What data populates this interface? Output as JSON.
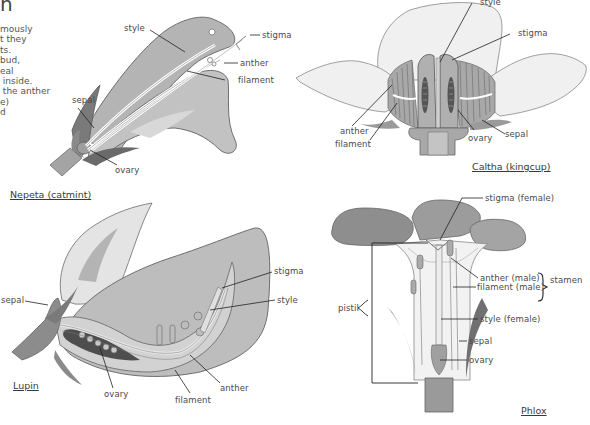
{
  "intro_text": {
    "heading_fragment": "n",
    "lines": [
      "mously",
      "t they",
      "ts.",
      "bud,",
      "eal",
      " inside.",
      " the anther",
      "e)",
      "d"
    ]
  },
  "diagrams": {
    "nepeta": {
      "title": "Nepeta (catmint)",
      "labels": {
        "style": "style",
        "stigma": "stigma",
        "anther": "anther",
        "filament": "filament",
        "sepal": "sepal",
        "ovary": "ovary"
      }
    },
    "caltha": {
      "title": "Caltha (kingcup)",
      "labels": {
        "style": "style",
        "stigma": "stigma",
        "anther": "anther",
        "filament": "filament",
        "ovary": "ovary",
        "sepal": "sepal"
      }
    },
    "lupin": {
      "title": "Lupin",
      "labels": {
        "sepal": "sepal",
        "stigma": "stigma",
        "style": "style",
        "anther": "anther",
        "filament": "filament",
        "ovary": "ovary"
      }
    },
    "phlox": {
      "title": "Phlox",
      "labels": {
        "stigma": "stigma (female)",
        "anther": "anther (male)",
        "filament": "filament (male)",
        "stamen": "stamen",
        "pistil": "pistil",
        "style": "style (female)",
        "sepal": "sepal",
        "ovary": "ovary"
      }
    }
  },
  "colors": {
    "petal_dark": "#9a9a9a",
    "petal_mid": "#b8b8b8",
    "petal_light": "#d8d8d8",
    "petal_pale": "#ececec",
    "outline": "#6e6e6e",
    "leader_line": "#222222",
    "text": "#4a4a4a"
  }
}
